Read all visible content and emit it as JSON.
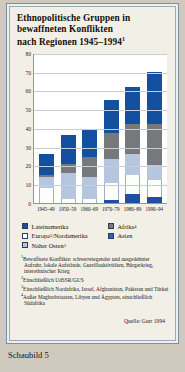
{
  "figure": {
    "title_line1": "Ethnopolitische Gruppen in",
    "title_line2": "bewaffneten Konflikten",
    "title_line3": "nach Regionen 1945–1994",
    "title_marker": "1",
    "source": "Quelle: Gurr 1994",
    "caption": "Schaubild 5"
  },
  "chart_data": {
    "type": "bar",
    "stacked": true,
    "title": "Ethnopolitische Gruppen in bewaffneten Konflikten nach Regionen 1945–1994",
    "xlabel": "",
    "ylabel": "",
    "ylim": [
      0,
      80
    ],
    "yticks": [
      0,
      10,
      20,
      30,
      40,
      50,
      60,
      70,
      80
    ],
    "grid": true,
    "legend_position": "below",
    "categories": [
      "1945–49",
      "1950–59",
      "1960–69",
      "1970–79",
      "1980–89",
      "1990–94"
    ],
    "series": [
      {
        "name": "Lateinamerika",
        "color": "#1f4fa3",
        "values": [
          0,
          0,
          0,
          1.5,
          5,
          3
        ]
      },
      {
        "name": "Europa/Nordamerika",
        "color": "#ffffff",
        "values": [
          8,
          2,
          2,
          9,
          10,
          9
        ]
      },
      {
        "name": "Naher Osten",
        "color": "#b6c6de",
        "values": [
          6,
          14,
          12,
          13,
          11,
          8
        ]
      },
      {
        "name": "Afrika",
        "color": "#77787a",
        "values": [
          1,
          5,
          10.5,
          14,
          16,
          22
        ]
      },
      {
        "name": "Asien",
        "color": "#13509f",
        "values": [
          11,
          15,
          15,
          17.5,
          20,
          28
        ]
      }
    ],
    "totals": [
      26,
      36,
      39.5,
      55,
      62,
      70
    ]
  },
  "legend": [
    {
      "label": "Lateinamerika",
      "marker": ""
    },
    {
      "label": "Afrika",
      "marker": "4"
    },
    {
      "label": "Europa",
      "marker": "2",
      "label_tail": "/Nordamerika"
    },
    {
      "label": "Asien",
      "marker": ""
    },
    {
      "label": "Naher Osten",
      "marker": "3"
    }
  ],
  "footnotes": [
    {
      "marker": "1",
      "text": "Bewaffnete Konflikte: schwerwiegender und ausgedehnter Aufruhr, lokale Aufstände, Guerillaaktivitäten, Bürgerkrieg, interethnischer Krieg"
    },
    {
      "marker": "2",
      "text": "Einschließlich UdSSR/GUS"
    },
    {
      "marker": "3",
      "text": "Einschließlich Nordafrika, Israel, Afghanistan, Pakistan und Türkei"
    },
    {
      "marker": "4",
      "text": "Außer Maghrebstaaten, Libyen und Ägypten, einschließlich Südafrika"
    }
  ]
}
